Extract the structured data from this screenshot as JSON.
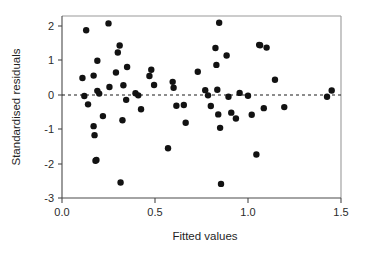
{
  "chart_data": {
    "type": "scatter",
    "title": "",
    "xlabel": "Fitted values",
    "ylabel": "Standardised residuals",
    "xlim": [
      0.0,
      1.5
    ],
    "ylim": [
      -3,
      2.3
    ],
    "xticks": [
      0.0,
      0.5,
      1.0,
      1.5
    ],
    "xticklabels": [
      "0.0",
      "0.5",
      "1.0",
      "1.5"
    ],
    "yticks": [
      2,
      1,
      0,
      -1,
      -2,
      -3
    ],
    "yticklabels": [
      "2",
      "1",
      "0",
      "-1",
      "-2",
      "-3"
    ],
    "grid": false,
    "legend": null,
    "annotations": [
      {
        "type": "hline",
        "y": 0,
        "style": "dashed",
        "color": "#1a1a1a"
      }
    ],
    "marker": {
      "shape": "circle",
      "size": 3.2,
      "color": "#121212"
    },
    "series": [
      {
        "name": "residuals",
        "points": [
          [
            0.11,
            0.49
          ],
          [
            0.12,
            -0.03
          ],
          [
            0.13,
            1.87
          ],
          [
            0.14,
            -0.27
          ],
          [
            0.17,
            0.56
          ],
          [
            0.17,
            -0.9
          ],
          [
            0.175,
            -1.16
          ],
          [
            0.18,
            -1.9
          ],
          [
            0.185,
            -1.88
          ],
          [
            0.19,
            0.99
          ],
          [
            0.19,
            0.12
          ],
          [
            0.2,
            0.04
          ],
          [
            0.22,
            -0.61
          ],
          [
            0.25,
            2.07
          ],
          [
            0.255,
            0.23
          ],
          [
            0.29,
            0.65
          ],
          [
            0.3,
            1.23
          ],
          [
            0.31,
            1.43
          ],
          [
            0.315,
            -2.53
          ],
          [
            0.325,
            -0.73
          ],
          [
            0.33,
            0.28
          ],
          [
            0.345,
            -0.14
          ],
          [
            0.35,
            0.81
          ],
          [
            0.395,
            0.05
          ],
          [
            0.41,
            -0.01
          ],
          [
            0.425,
            -0.41
          ],
          [
            0.47,
            0.55
          ],
          [
            0.48,
            0.73
          ],
          [
            0.495,
            0.29
          ],
          [
            0.57,
            -1.54
          ],
          [
            0.595,
            0.38
          ],
          [
            0.6,
            0.21
          ],
          [
            0.615,
            -0.31
          ],
          [
            0.655,
            -0.29
          ],
          [
            0.665,
            -0.8
          ],
          [
            0.73,
            0.67
          ],
          [
            0.77,
            0.14
          ],
          [
            0.785,
            -0.01
          ],
          [
            0.8,
            -0.32
          ],
          [
            0.825,
            1.36
          ],
          [
            0.83,
            0.87
          ],
          [
            0.835,
            0.15
          ],
          [
            0.84,
            -0.56
          ],
          [
            0.845,
            2.09
          ],
          [
            0.85,
            -0.95
          ],
          [
            0.855,
            -2.57
          ],
          [
            0.885,
            1.14
          ],
          [
            0.895,
            -0.05
          ],
          [
            0.91,
            -0.51
          ],
          [
            0.935,
            -0.68
          ],
          [
            0.955,
            0.06
          ],
          [
            1.0,
            -0.02
          ],
          [
            1.02,
            -0.57
          ],
          [
            1.045,
            -1.72
          ],
          [
            1.06,
            1.45
          ],
          [
            1.065,
            1.44
          ],
          [
            1.085,
            -0.38
          ],
          [
            1.1,
            1.37
          ],
          [
            1.145,
            0.44
          ],
          [
            1.195,
            -0.35
          ],
          [
            1.425,
            -0.05
          ],
          [
            1.45,
            0.13
          ]
        ]
      }
    ]
  },
  "figure": {
    "plot_area": {
      "left": 62,
      "right": 341,
      "top": 16,
      "bottom": 198
    },
    "y_zero_px": 95,
    "y_unit_px": 34.6
  }
}
